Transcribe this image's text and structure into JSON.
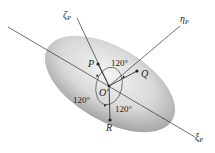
{
  "diagram": {
    "axes": {
      "xi": {
        "symbol": "ξ",
        "sub": "P"
      },
      "zeta": {
        "symbol": "ζ",
        "sub": "P"
      },
      "eta": {
        "symbol": "η",
        "sub": "P"
      }
    },
    "points": {
      "origin": "O'",
      "p": "P",
      "q": "Q",
      "r": "R"
    },
    "angles": {
      "top": "120°",
      "left": "120°",
      "bottom": "120°"
    },
    "colors": {
      "line": "#333333",
      "body_light": "#f2f2f2",
      "body_dark": "#9a9a9a"
    }
  }
}
